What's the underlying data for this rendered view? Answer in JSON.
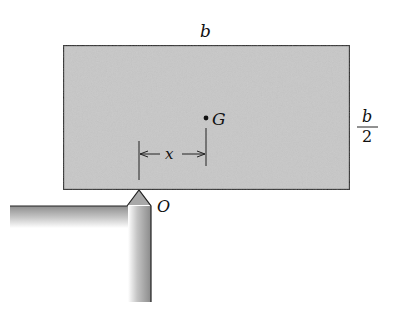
{
  "diagram": {
    "type": "statics-free-body",
    "labels": {
      "width": "b",
      "height_numerator": "b",
      "height_denominator": "2",
      "center_of_mass": "G",
      "offset": "x",
      "support_point": "O"
    },
    "colors": {
      "block_fill": "#c8c8c8",
      "outline": "#222222",
      "support_dark": "#8a8a8a",
      "background": "#ffffff"
    }
  }
}
